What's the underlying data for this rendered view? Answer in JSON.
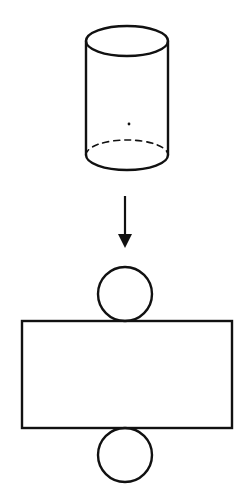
{
  "diagram": {
    "title": "",
    "colors": {
      "stroke": "#111111",
      "background": "#ffffff"
    },
    "cylinder": {
      "top_ellipse": {
        "cx": 127,
        "cy": 41,
        "rx": 41,
        "ry": 15
      },
      "bottom_ellipse": {
        "cx": 127,
        "cy": 155,
        "rx": 41,
        "ry": 15,
        "back_half": "dashed"
      },
      "left_x": 86,
      "right_x": 168,
      "center_dot": {
        "cx": 129,
        "cy": 124
      }
    },
    "arrow": {
      "x": 125,
      "y1": 196,
      "y2": 248,
      "direction": "down"
    },
    "net": {
      "top_circle": {
        "cx": 125,
        "cy": 294,
        "r": 27
      },
      "rectangle": {
        "x": 22,
        "y": 321,
        "width": 210,
        "height": 107
      },
      "bottom_circle": {
        "cx": 125,
        "cy": 455,
        "r": 27
      }
    }
  }
}
